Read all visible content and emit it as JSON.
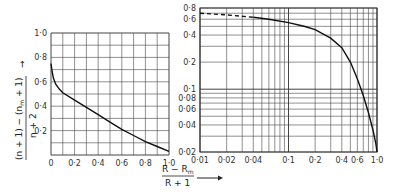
{
  "chart_data": [
    {
      "type": "line",
      "title": "",
      "xlabel": "",
      "ylabel": "((n+1) - (n_m+1)) / (n+2)",
      "xlim": [
        0,
        1.0
      ],
      "ylim": [
        0,
        1.0
      ],
      "xscale": "linear",
      "yscale": "linear",
      "grid": true,
      "x_ticks": [
        "0",
        "0·2",
        "0·4",
        "0·6",
        "0·8",
        "1·0"
      ],
      "y_ticks": [
        "0·2",
        "0·4",
        "0·6",
        "0·8",
        "1·0"
      ],
      "series": [
        {
          "name": "curve",
          "style": "solid",
          "x": [
            0.0,
            0.01,
            0.02,
            0.04,
            0.07,
            0.1,
            0.2,
            0.3,
            0.4,
            0.5,
            0.6,
            0.7,
            0.8,
            0.9,
            1.0
          ],
          "y": [
            0.75,
            0.68,
            0.63,
            0.58,
            0.54,
            0.51,
            0.45,
            0.39,
            0.33,
            0.27,
            0.21,
            0.16,
            0.11,
            0.07,
            0.03
          ]
        }
      ]
    },
    {
      "type": "line",
      "title": "",
      "xlabel": "(R - R_m) / (R+1)",
      "ylabel": "",
      "xlim": [
        0.01,
        1.0
      ],
      "ylim": [
        0.02,
        0.8
      ],
      "xscale": "log",
      "yscale": "log",
      "grid": true,
      "x_ticks": [
        "0·01",
        "0·02",
        "0·04",
        "0·1",
        "0·2",
        "0·4",
        "0·6",
        "1·0"
      ],
      "y_ticks": [
        "0·02",
        "0·04",
        "0·06",
        "0·08",
        "0·1",
        "0·2",
        "0·4",
        "0·6",
        "0·8"
      ],
      "series": [
        {
          "name": "extrapolated",
          "style": "dashed",
          "x": [
            0.01,
            0.02,
            0.04
          ],
          "y": [
            0.7,
            0.67,
            0.63
          ]
        },
        {
          "name": "curve",
          "style": "solid",
          "x": [
            0.04,
            0.06,
            0.1,
            0.15,
            0.2,
            0.3,
            0.4,
            0.5,
            0.6,
            0.7,
            0.8,
            0.9,
            0.97,
            1.0
          ],
          "y": [
            0.63,
            0.6,
            0.55,
            0.5,
            0.46,
            0.37,
            0.29,
            0.2,
            0.13,
            0.085,
            0.055,
            0.035,
            0.025,
            0.02
          ]
        }
      ]
    }
  ],
  "labels": {
    "left_ylabel_num": "(n + 1) − (n",
    "left_ylabel_sub": "m",
    "left_ylabel_num_end": " + 1)",
    "left_ylabel_den": "n + 2",
    "right_xlabel_num": "R − R",
    "right_xlabel_sub": "m",
    "right_xlabel_den": "R + 1",
    "arrow": "→"
  }
}
